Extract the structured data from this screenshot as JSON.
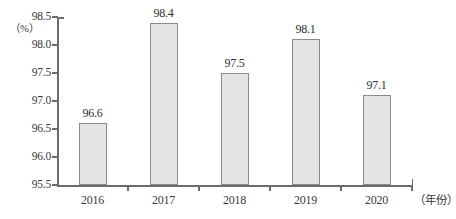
{
  "chart_data": {
    "type": "bar",
    "title": "",
    "xlabel": "（年份）",
    "ylabel": "（%）",
    "categories": [
      "2016",
      "2017",
      "2018",
      "2019",
      "2020"
    ],
    "values": [
      96.6,
      98.4,
      97.5,
      98.1,
      97.1
    ],
    "value_labels": [
      "96.6",
      "98.4",
      "97.5",
      "98.1",
      "97.1"
    ],
    "ylim": [
      95.5,
      98.5
    ],
    "ytick_step": 0.5,
    "ytick_labels": [
      "98.5",
      "98.0",
      "97.5",
      "97.0",
      "96.5",
      "96.0",
      "95.5"
    ],
    "ytick_values": [
      98.5,
      98.0,
      97.5,
      97.0,
      96.5,
      96.0,
      95.5
    ],
    "grid": false,
    "legend": false,
    "bar_fill_color": "#e4e4e4",
    "bar_border_color": "#8a8a8a",
    "axis_color": "#6b6b6b",
    "text_color": "#3a3a3a"
  }
}
